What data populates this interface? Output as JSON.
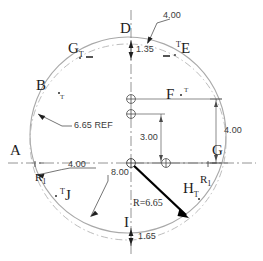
{
  "drawing": {
    "title": "Datum target layout drawing",
    "colors": {
      "outline": "#a8a8a8",
      "centerline": "#6e6e6e",
      "dimension": "#5a5a5a",
      "radius_arrow": "#000000",
      "text": "#2b2b2b",
      "background": "#ffffff"
    },
    "datum_labels": [
      {
        "name": "datum-a",
        "text": "A",
        "sup": "",
        "sub": ""
      },
      {
        "name": "datum-b",
        "text": "B",
        "sup": "",
        "sub": ""
      },
      {
        "name": "datum-d",
        "text": "D",
        "sup": "",
        "sub": ""
      },
      {
        "name": "datum-e",
        "text": "E",
        "sup": "T",
        "sub": ""
      },
      {
        "name": "datum-f",
        "text": "F",
        "sup": "",
        "sub": ""
      },
      {
        "name": "datum-g-top",
        "text": "G",
        "sup": "",
        "sub": "T"
      },
      {
        "name": "datum-g-right",
        "text": "G",
        "sup": "",
        "sub": ""
      },
      {
        "name": "datum-h",
        "text": "H",
        "sup": "",
        "sub": "T"
      },
      {
        "name": "datum-i",
        "text": "I",
        "sup": "",
        "sub": ""
      },
      {
        "name": "datum-j",
        "text": "J",
        "sup": "T",
        "sub": ""
      }
    ],
    "radius_labels": [
      {
        "name": "radius-r1-left",
        "text": "R",
        "sub": "1"
      },
      {
        "name": "radius-r1-right",
        "text": "R",
        "sub": "1"
      }
    ],
    "target_marks": [
      {
        "name": "target-mark-b",
        "text": "T"
      },
      {
        "name": "target-mark-f",
        "text": "T"
      },
      {
        "name": "target-mark-a",
        "text": "T"
      },
      {
        "name": "target-mark-g-right",
        "text": "T"
      }
    ],
    "dimensions": {
      "top_leader": "4.00",
      "top_vertical": "1.35",
      "reference_diameter": "6.65 REF",
      "left_horizontal": "4.00",
      "center_vertical": "3.00",
      "right_vertical": "4.00",
      "overall": "8.00",
      "radius": "R=6.65",
      "bottom_vertical": "1.65"
    }
  }
}
